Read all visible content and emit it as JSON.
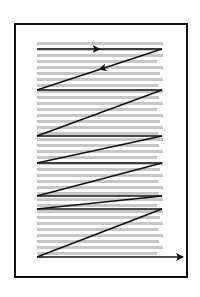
{
  "diagram": {
    "frame": {
      "x": 14,
      "y": 23,
      "width": 172,
      "height": 253,
      "stroke": "#111111"
    },
    "text_area": {
      "x": 37,
      "y": 42,
      "width": 126,
      "height": 220,
      "line_color": "#bdbdbd",
      "line_count": 36,
      "line_spacing": 6
    },
    "path_color": "#111111",
    "path_segments": [
      {
        "from": [
          37,
          49
        ],
        "to": [
          162,
          49
        ],
        "arrow_mid": true
      },
      {
        "from": [
          162,
          49
        ],
        "to": [
          37,
          90
        ],
        "arrow_mid": true
      },
      {
        "from": [
          37,
          90
        ],
        "to": [
          162,
          90
        ]
      },
      {
        "from": [
          162,
          90
        ],
        "to": [
          37,
          136
        ]
      },
      {
        "from": [
          37,
          136
        ],
        "to": [
          162,
          136
        ]
      },
      {
        "from": [
          162,
          136
        ],
        "to": [
          37,
          163
        ]
      },
      {
        "from": [
          37,
          163
        ],
        "to": [
          162,
          163
        ]
      },
      {
        "from": [
          162,
          163
        ],
        "to": [
          37,
          196
        ]
      },
      {
        "from": [
          37,
          196
        ],
        "to": [
          162,
          196
        ]
      },
      {
        "from": [
          162,
          196
        ],
        "to": [
          37,
          209
        ]
      },
      {
        "from": [
          37,
          209
        ],
        "to": [
          162,
          209
        ]
      },
      {
        "from": [
          162,
          209
        ],
        "to": [
          37,
          257
        ]
      },
      {
        "from": [
          37,
          257
        ],
        "to": [
          183,
          257
        ],
        "arrow_end": true
      }
    ]
  }
}
